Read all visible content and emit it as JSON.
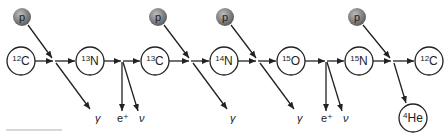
{
  "colors": {
    "line": "#222222",
    "node_fill": "#ffffff",
    "proton_fill": "#7a7a7a",
    "proton_highlight": "#bdbdbd"
  },
  "nodes": [
    {
      "id": "n0",
      "mass": "12",
      "symbol": "C",
      "x": 21,
      "y": 61
    },
    {
      "id": "n1",
      "mass": "13",
      "symbol": "N",
      "x": 90,
      "y": 61
    },
    {
      "id": "n2",
      "mass": "13",
      "symbol": "C",
      "x": 155,
      "y": 61
    },
    {
      "id": "n3",
      "mass": "14",
      "symbol": "N",
      "x": 224,
      "y": 61
    },
    {
      "id": "n4",
      "mass": "15",
      "symbol": "O",
      "x": 291,
      "y": 61
    },
    {
      "id": "n5",
      "mass": "15",
      "symbol": "N",
      "x": 359,
      "y": 61
    },
    {
      "id": "n6",
      "mass": "12",
      "symbol": "C",
      "x": 429,
      "y": 61
    },
    {
      "id": "n7",
      "mass": "4",
      "symbol": "He",
      "x": 413,
      "y": 118
    }
  ],
  "protons": [
    {
      "label": "p",
      "x": 22,
      "y": 17,
      "join_x": 53
    },
    {
      "label": "p",
      "x": 158,
      "y": 17,
      "join_x": 190
    },
    {
      "label": "p",
      "x": 225,
      "y": 17,
      "join_x": 257
    },
    {
      "label": "p",
      "x": 357,
      "y": 17,
      "join_x": 392
    }
  ],
  "emissions": [
    {
      "label": "γ",
      "x": 95,
      "y": 121
    },
    {
      "label": "e⁺",
      "x": 120,
      "y": 121
    },
    {
      "label": "ν",
      "x": 143,
      "y": 121
    },
    {
      "label": "γ",
      "x": 232,
      "y": 121
    },
    {
      "label": "γ",
      "x": 299,
      "y": 121
    },
    {
      "label": "e⁺",
      "x": 324,
      "y": 121
    },
    {
      "label": "ν",
      "x": 347,
      "y": 121
    }
  ]
}
